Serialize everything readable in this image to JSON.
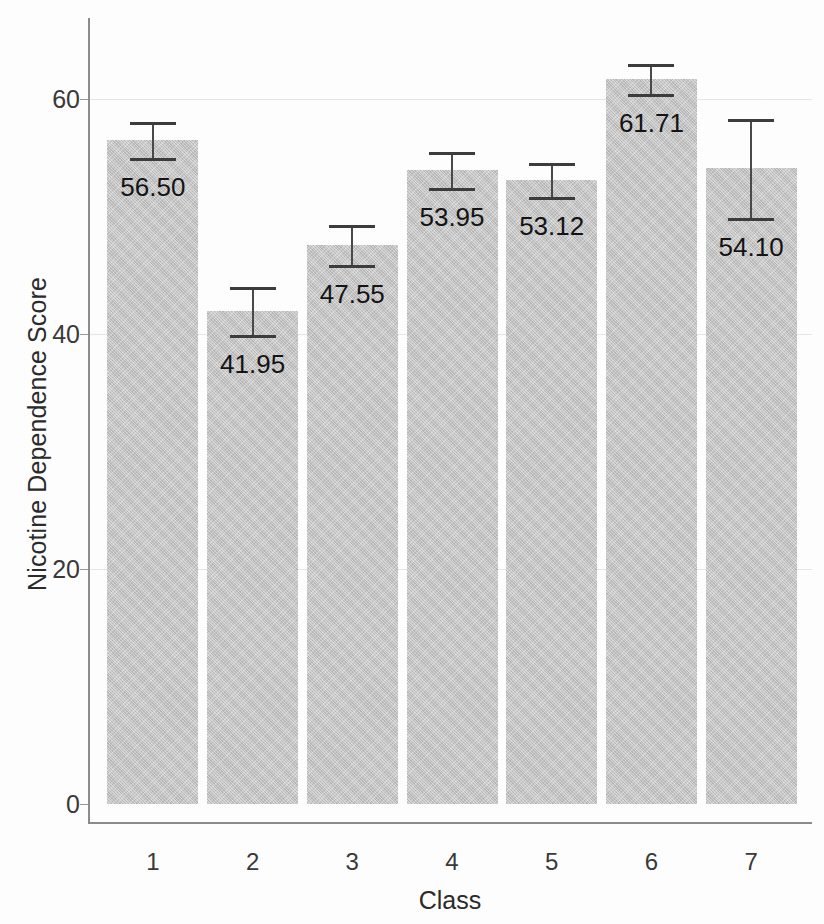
{
  "chart_data": {
    "type": "bar",
    "title": "",
    "xlabel": "Class",
    "ylabel": "Nicotine Dependence Score",
    "categories": [
      "1",
      "2",
      "3",
      "4",
      "5",
      "6",
      "7"
    ],
    "values": [
      56.5,
      41.95,
      47.55,
      53.95,
      53.12,
      61.71,
      54.1
    ],
    "value_labels": [
      "56.50",
      "41.95",
      "47.55",
      "53.95",
      "53.12",
      "61.71",
      "54.10"
    ],
    "errors": [
      1.55,
      2.05,
      1.7,
      1.55,
      1.45,
      1.3,
      4.2
    ],
    "ylim": [
      0,
      65
    ],
    "yticks": [
      0,
      20,
      40,
      60
    ],
    "ytick_labels": [
      "0",
      "20",
      "40",
      "60"
    ],
    "grid": true,
    "legend": "none",
    "bar_color": "#c9c9c9",
    "error_bar_color": "#3d3d3d",
    "axis_color": "#8d8d8d",
    "text_color": "#2b2b2b"
  }
}
